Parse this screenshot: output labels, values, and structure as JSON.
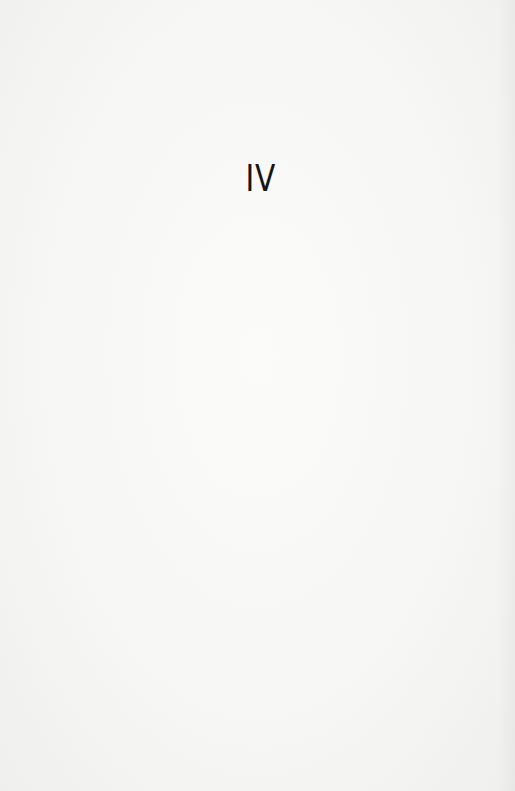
{
  "page": {
    "part_numeral": "IV"
  }
}
